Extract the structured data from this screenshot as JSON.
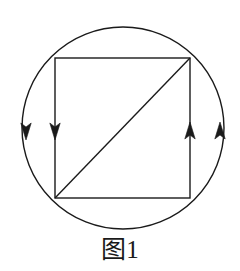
{
  "figure": {
    "caption": "图1",
    "background_color": "#ffffff",
    "stroke_color": "#1a1a1a",
    "stroke_width": 1.4
  },
  "diagram": {
    "type": "geometric-figure",
    "description_parts": [
      "circle",
      "inscribed-square",
      "square-diagonal",
      "direction-arrows"
    ],
    "circle": {
      "name": "outer-circle",
      "cx": 123,
      "cy": 128,
      "r": 101
    },
    "square": {
      "name": "inscribed-square",
      "left": 55,
      "top": 58,
      "right": 190,
      "bottom": 198,
      "corners": [
        {
          "label": "top-left",
          "x": 55,
          "y": 58
        },
        {
          "label": "top-right",
          "x": 190,
          "y": 58
        },
        {
          "label": "bottom-right",
          "x": 190,
          "y": 198
        },
        {
          "label": "bottom-left",
          "x": 55,
          "y": 198
        }
      ]
    },
    "diagonal": {
      "name": "square-diagonal",
      "x1": 55,
      "y1": 198,
      "x2": 190,
      "y2": 58
    },
    "arrows": [
      {
        "name": "left-arc-arrow",
        "on": "circle-left-arc",
        "direction": "down",
        "tip_x": 26,
        "tip_y": 140
      },
      {
        "name": "left-side-arrow",
        "on": "square-left-side",
        "direction": "down",
        "tip_x": 55,
        "tip_y": 140
      },
      {
        "name": "right-side-arrow",
        "on": "square-right-side",
        "direction": "up",
        "tip_x": 190,
        "tip_y": 122
      },
      {
        "name": "right-arc-arrow",
        "on": "circle-right-arc",
        "direction": "up",
        "tip_x": 220,
        "tip_y": 122
      }
    ]
  }
}
